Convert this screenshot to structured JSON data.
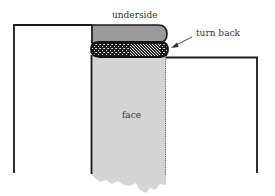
{
  "diagram": {
    "labels": {
      "underside": "underside",
      "turn_back": "turn back",
      "face": "face"
    },
    "colors": {
      "outline": "#1a1a1a",
      "underside_fill": "#9a9a9a",
      "face_fill": "#d4d4d4",
      "roll_fill": "#1c1c1c",
      "background": "#ffffff"
    }
  }
}
